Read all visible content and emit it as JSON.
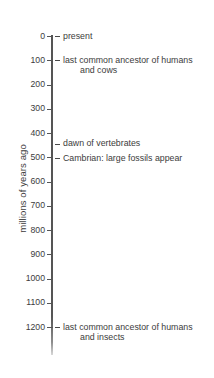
{
  "chart_data": {
    "type": "timeline",
    "title": "",
    "ylabel": "millions of years ago",
    "xlabel": "",
    "ylim": [
      0,
      1250
    ],
    "y_inverted": true,
    "grid": false,
    "legend": null,
    "tick_values": [
      0,
      100,
      200,
      300,
      400,
      500,
      600,
      700,
      800,
      900,
      1000,
      1100,
      1200
    ],
    "tick_labels": [
      "0",
      "100",
      "200",
      "300",
      "400",
      "500",
      "600",
      "700",
      "800",
      "900",
      "1000",
      "1100",
      "1200"
    ],
    "events": [
      {
        "value": 0,
        "line1": "present",
        "line2": ""
      },
      {
        "value": 100,
        "line1": "last common ancestor of humans",
        "line2": "and cows"
      },
      {
        "value": 445,
        "line1": "dawn of vertebrates",
        "line2": ""
      },
      {
        "value": 505,
        "line1": "Cambrian: large fossils appear",
        "line2": ""
      },
      {
        "value": 1200,
        "line1": "last common ancestor of humans",
        "line2": "and insects"
      }
    ],
    "colors": {
      "axis": "#555555",
      "text": "#3c3c3c",
      "background": "#ffffff"
    }
  }
}
